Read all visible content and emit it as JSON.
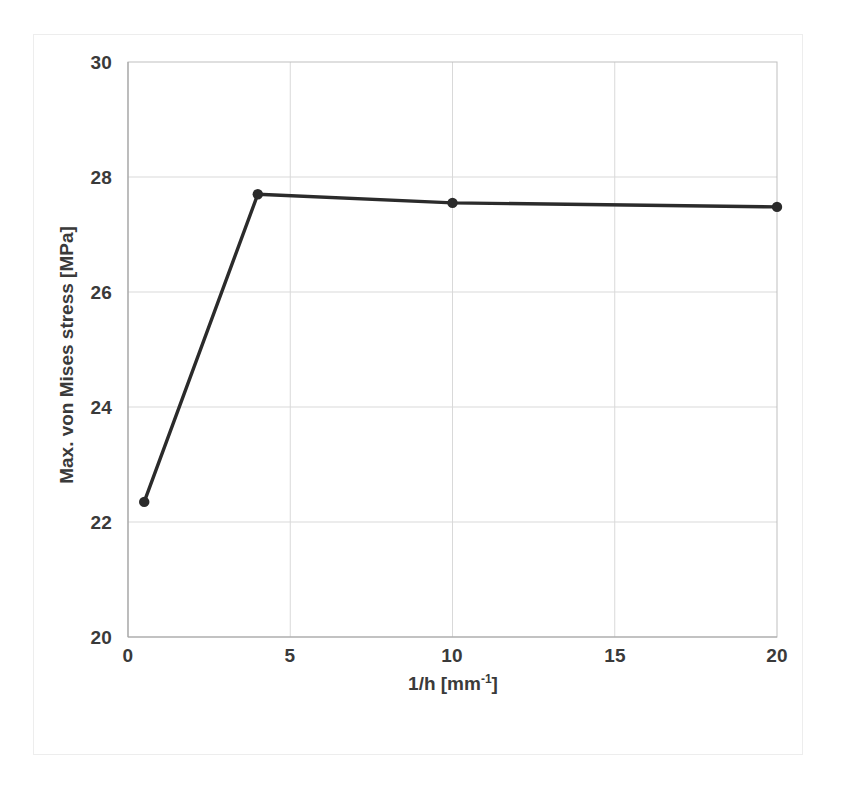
{
  "chart_data": {
    "type": "line",
    "title": "",
    "subtitle": "",
    "xlabel_text": "1/h [mm",
    "xlabel_sup": "-1",
    "xlabel_tail": "]",
    "xlabel": "1/h [mm-1]",
    "ylabel": "Max. von Mises stress [MPa]",
    "xlim": [
      0,
      20
    ],
    "ylim": [
      20,
      30
    ],
    "xticks": [
      "0",
      "5",
      "10",
      "15",
      "20"
    ],
    "xtick_values": [
      0,
      5,
      10,
      15,
      20
    ],
    "yticks": [
      "20",
      "22",
      "24",
      "26",
      "28",
      "30"
    ],
    "ytick_values": [
      20,
      22,
      24,
      26,
      28,
      30
    ],
    "grid": true,
    "grid_color": "#d9d9d9",
    "legend": null,
    "legend_position": "none",
    "series": [
      {
        "name": "Max. von Mises stress",
        "color": "#2b2b2b",
        "marker": "circle",
        "x": [
          0.5,
          4,
          10,
          20
        ],
        "values": [
          22.35,
          27.7,
          27.55,
          27.48
        ]
      }
    ]
  },
  "figure": {
    "background_color": "#ffffff",
    "frame_color": "#ededed",
    "axis_color": "#bfbfbf",
    "text_color": "#3a3a3a"
  }
}
